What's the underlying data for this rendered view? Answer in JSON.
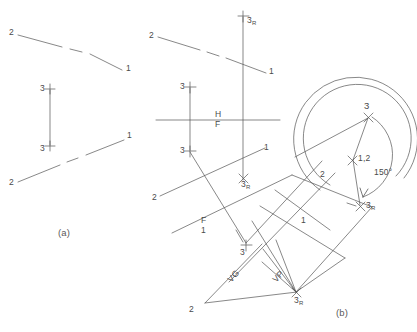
{
  "figure": {
    "captions": {
      "a": "(a)",
      "b": "(b)"
    }
  },
  "panel_a": {
    "name": "Given views",
    "top_line": {
      "start_label": "2",
      "end_label": "1"
    },
    "bottom_line": {
      "start_label": "2",
      "end_label": "1"
    },
    "point_top": "3",
    "point_bottom": "3"
  },
  "panel_b": {
    "name": "Solution construction",
    "fold_lines": [
      {
        "upper": "H",
        "lower": "F"
      },
      {
        "upper": "F",
        "lower": "1"
      }
    ],
    "angle_label": "150°",
    "points": [
      {
        "label": "3",
        "sub": "R",
        "where": "top-vertical"
      },
      {
        "label": "3",
        "sub": "",
        "where": "upper-left-cross"
      },
      {
        "label": "3",
        "sub": "",
        "where": "mid-left-cross"
      },
      {
        "label": "3",
        "sub": "R",
        "where": "mid-center-x"
      },
      {
        "label": "3",
        "sub": "",
        "where": "lower-center-cross"
      },
      {
        "label": "3",
        "sub": "R",
        "where": "bottom-convergence-x"
      },
      {
        "label": "3",
        "sub": "",
        "where": "arc-apex-x"
      },
      {
        "label": "3",
        "sub": "R",
        "where": "arc-right-x"
      },
      {
        "label": "1,2",
        "sub": "",
        "where": "point-view-x"
      }
    ],
    "line_labels": [
      {
        "text": "2",
        "where": "top-left"
      },
      {
        "text": "1",
        "where": "top-right"
      },
      {
        "text": "1",
        "where": "mid-right"
      },
      {
        "text": "2",
        "where": "mid-left"
      },
      {
        "text": "1",
        "where": "aux-right"
      },
      {
        "text": "2",
        "where": "aux-upper"
      },
      {
        "text": "2",
        "where": "bottom-left"
      }
    ],
    "trace_labels": [
      {
        "text": "VG",
        "meaning": "true-length-view"
      },
      {
        "text": "VP",
        "meaning": "point-view"
      }
    ]
  }
}
